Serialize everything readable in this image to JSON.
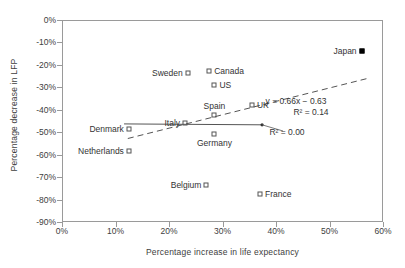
{
  "chart_data": {
    "type": "scatter",
    "title": "",
    "xlabel": "Percentage increase in life expectancy",
    "ylabel": "Percentage decrease in LFP",
    "xlim": [
      0,
      60
    ],
    "ylim": [
      -90,
      0
    ],
    "xticks": [
      "0%",
      "10%",
      "20%",
      "30%",
      "40%",
      "50%",
      "60%"
    ],
    "xtick_values": [
      0,
      10,
      20,
      30,
      40,
      50,
      60
    ],
    "yticks": [
      "0%",
      "-10%",
      "-20%",
      "-30%",
      "-40%",
      "-50%",
      "-60%",
      "-70%",
      "-80%",
      "-90%"
    ],
    "ytick_values": [
      0,
      -10,
      -20,
      -30,
      -40,
      -50,
      -60,
      -70,
      -80,
      -90
    ],
    "grid": false,
    "legend": null,
    "points": [
      {
        "label": "Japan",
        "x": 56.0,
        "y": -14.0,
        "marker": "filled-square",
        "label_side": "left"
      },
      {
        "label": "Sweden",
        "x": 23.5,
        "y": -23.5,
        "marker": "open-square",
        "label_side": "left"
      },
      {
        "label": "Canada",
        "x": 27.5,
        "y": -22.5,
        "marker": "open-square",
        "label_side": "right"
      },
      {
        "label": "US",
        "x": 28.5,
        "y": -29.0,
        "marker": "open-square",
        "label_side": "right"
      },
      {
        "label": "UK",
        "x": 35.5,
        "y": -38.0,
        "marker": "open-square",
        "label_side": "right"
      },
      {
        "label": "Spain",
        "x": 28.5,
        "y": -42.5,
        "marker": "open-square",
        "label_side": "above"
      },
      {
        "label": "Italy",
        "x": 23.0,
        "y": -46.0,
        "marker": "open-square",
        "label_side": "left"
      },
      {
        "label": "Germany",
        "x": 28.5,
        "y": -51.0,
        "marker": "open-square",
        "label_side": "below"
      },
      {
        "label": "Denmark",
        "x": 12.5,
        "y": -48.5,
        "marker": "open-square",
        "label_side": "left"
      },
      {
        "label": "Netherlands",
        "x": 12.5,
        "y": -58.5,
        "marker": "open-square",
        "label_side": "left"
      },
      {
        "label": "Belgium",
        "x": 27.0,
        "y": -73.5,
        "marker": "open-square",
        "label_side": "left"
      },
      {
        "label": "France",
        "x": 37.0,
        "y": -77.5,
        "marker": "open-square",
        "label_side": "right"
      }
    ],
    "trendlines": [
      {
        "name": "dashed-fit",
        "style": "dashed",
        "equation": "y = 0.66x − 0.63",
        "r2": "R² = 0.14",
        "r2_value": 0.14,
        "slope": 0.66,
        "intercept": -0.63,
        "x_start": 12.3,
        "y_start": -52.8,
        "x_end": 57.5,
        "y_end": -25.8
      },
      {
        "name": "solid-fit",
        "style": "solid",
        "equation": "",
        "r2": "R² = 0.00",
        "r2_value": 0.0,
        "x_start": 11.6,
        "y_start": -46.3,
        "x_end": 37.4,
        "y_end": -46.7
      }
    ],
    "annotations": [
      {
        "name": "dashed-equation",
        "text": "y = 0.66x − 0.63",
        "x_px": 296,
        "y_px": 101
      },
      {
        "name": "dashed-r2",
        "text": "R² = 0.14",
        "x_px": 311,
        "y_px": 112
      },
      {
        "name": "solid-r2",
        "text": "R² = 0.00",
        "x_px": 287,
        "y_px": 132
      }
    ],
    "colors": {
      "frame": "#9a9a9a",
      "text": "#404040",
      "marker_outline": "#555555",
      "marker_fill": "#000000",
      "trendline": "#555555"
    }
  }
}
